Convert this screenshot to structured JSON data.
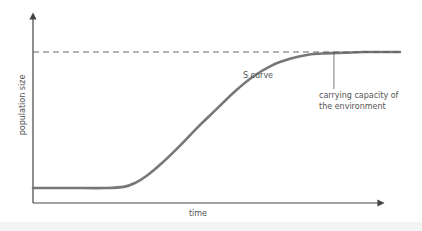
{
  "chart_data": {
    "type": "line",
    "title": "",
    "xlabel": "time",
    "ylabel": "population size",
    "xlim": [
      0,
      100
    ],
    "ylim": [
      0,
      100
    ],
    "grid": false,
    "legend": "none",
    "ticks": {
      "x": [],
      "y": []
    },
    "series": [
      {
        "name": "S curve",
        "x": [
          0,
          10,
          20,
          25,
          28,
          31,
          35,
          40,
          45,
          50,
          55,
          60,
          65,
          70,
          75,
          80,
          85,
          90,
          95,
          100
        ],
        "y": [
          0,
          0,
          0,
          1,
          4,
          9,
          18,
          31,
          45,
          58,
          71,
          82,
          90,
          95,
          98,
          99,
          99.5,
          100,
          100,
          100
        ],
        "color": "#777777",
        "style": "solid"
      },
      {
        "name": "carrying capacity of the environment",
        "x": [
          0,
          100
        ],
        "y": [
          100,
          100
        ],
        "color": "#555555",
        "style": "dashed"
      }
    ],
    "annotations": [
      {
        "text": "S curve",
        "x": 61,
        "y": 86
      },
      {
        "text_lines": [
          "carrying capacity of",
          "the environment"
        ],
        "x": 82,
        "y": 100,
        "pointer": true
      }
    ]
  }
}
